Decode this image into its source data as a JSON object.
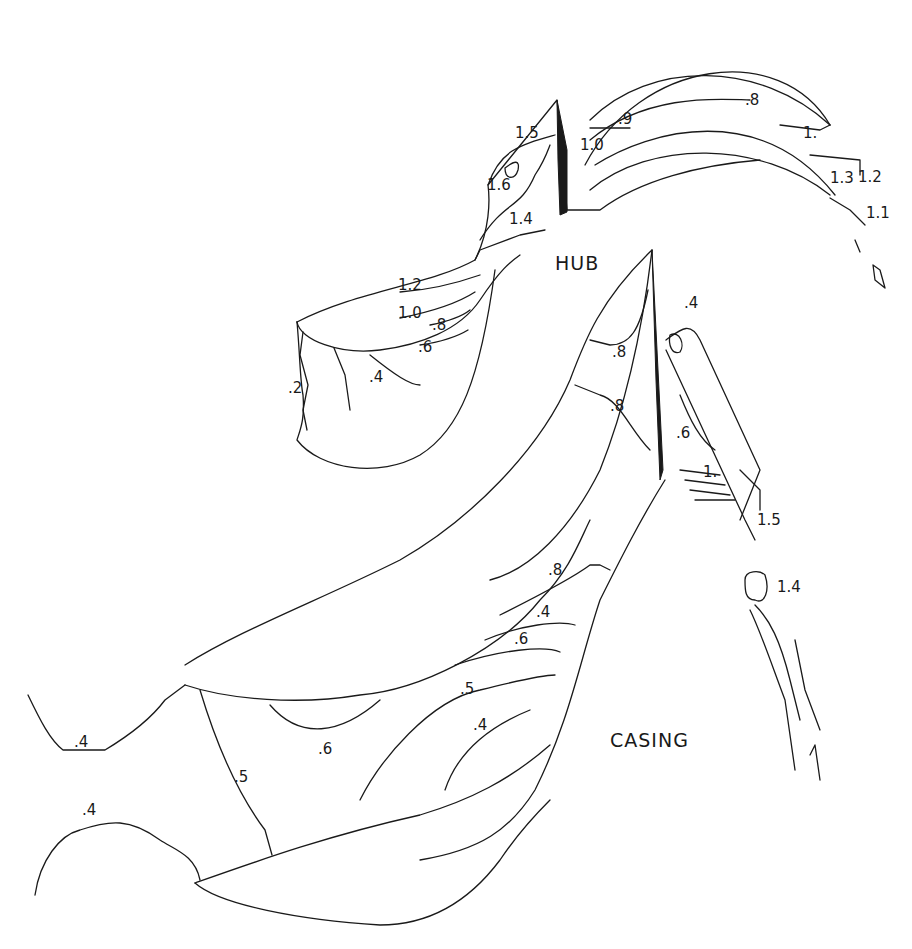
{
  "figure": {
    "type": "contour line drawing",
    "region_labels": {
      "hub": "HUB",
      "casing": "CASING"
    },
    "stroke_color": "#1a1a1a",
    "background_color": "#ffffff",
    "hub_passage_labels": {
      "top_blade": [
        "1.5",
        "1.6",
        "1.4"
      ],
      "upper_left_blade": [
        "1.2",
        "1.0",
        ".8",
        ".6",
        ".4",
        ".2"
      ],
      "arc_blade": [
        ".9",
        "1.0",
        ".8",
        "1.",
        "1.3",
        "1.2",
        "1.1"
      ],
      "center_blade": [
        ".8",
        ".8"
      ],
      "right_blade": [
        ".4",
        ".6",
        "1.",
        "1.5",
        "1.4"
      ]
    },
    "casing_passage_labels": {
      "lower_blade": [
        ".8",
        ".4",
        ".6",
        ".5",
        ".4",
        ".6",
        ".5"
      ],
      "left_region": [
        ".4",
        ".4"
      ]
    }
  }
}
